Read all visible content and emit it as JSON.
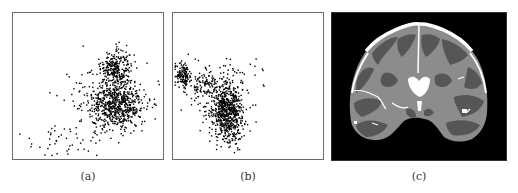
{
  "figure": {
    "panels": [
      {
        "id": "a",
        "caption": "(a)",
        "kind": "scatter"
      },
      {
        "id": "b",
        "caption": "(b)",
        "kind": "scatter"
      },
      {
        "id": "c",
        "caption": "(c)",
        "kind": "segmented-mri-coronal-slice"
      }
    ],
    "colors": {
      "frame": "#6a6a6a",
      "points": "#000000",
      "mri_background": "#000000",
      "white_matter": "#8c8c8c",
      "gray_matter": "#565656",
      "csf": "#ffffff"
    }
  },
  "chart_data": [
    {
      "type": "scatter",
      "title": "(a)",
      "xlabel": "",
      "ylabel": "",
      "grid": false,
      "axis_ticks": "none",
      "clusters": [
        {
          "name": "dense upper blob",
          "cx": 0.68,
          "cy": 0.38,
          "sx": 0.05,
          "sy": 0.06,
          "n": 260
        },
        {
          "name": "dense main body",
          "cx": 0.7,
          "cy": 0.63,
          "sx": 0.09,
          "sy": 0.08,
          "n": 520
        },
        {
          "name": "diffuse spread",
          "cx": 0.62,
          "cy": 0.58,
          "sx": 0.12,
          "sy": 0.12,
          "n": 200
        },
        {
          "name": "sparse tail to lower-left",
          "cx": 0.3,
          "cy": 0.88,
          "sx": 0.15,
          "sy": 0.06,
          "n": 45
        }
      ]
    },
    {
      "type": "scatter",
      "title": "(b)",
      "xlabel": "",
      "ylabel": "",
      "grid": false,
      "axis_ticks": "none",
      "clusters": [
        {
          "name": "left-edge blob",
          "cx": 0.06,
          "cy": 0.42,
          "sx": 0.03,
          "sy": 0.04,
          "n": 140
        },
        {
          "name": "connecting band",
          "cx": 0.2,
          "cy": 0.5,
          "sx": 0.07,
          "sy": 0.04,
          "n": 90
        },
        {
          "name": "main dense blob",
          "cx": 0.36,
          "cy": 0.68,
          "sx": 0.05,
          "sy": 0.1,
          "n": 600
        },
        {
          "name": "diffuse halo",
          "cx": 0.3,
          "cy": 0.6,
          "sx": 0.1,
          "sy": 0.12,
          "n": 140
        },
        {
          "name": "sparse upper-right",
          "cx": 0.45,
          "cy": 0.42,
          "sx": 0.12,
          "sy": 0.05,
          "n": 25
        }
      ]
    }
  ]
}
